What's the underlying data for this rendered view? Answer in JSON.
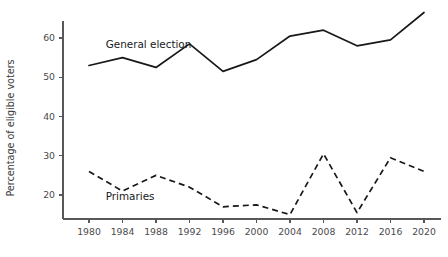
{
  "chart_data": {
    "type": "line",
    "title": "",
    "xlabel": "",
    "ylabel": "Percentage of eligible voters",
    "x": [
      1980,
      1984,
      1988,
      1992,
      1996,
      2000,
      2004,
      2008,
      2012,
      2016,
      2020
    ],
    "xtick_labels": [
      "1980",
      "1984",
      "1988",
      "1992",
      "1996",
      "2000",
      "2004",
      "2008",
      "2012",
      "2016",
      "2020"
    ],
    "ytick_labels": [
      "20",
      "30",
      "40",
      "50",
      "60"
    ],
    "yticks": [
      20,
      30,
      40,
      50,
      60
    ],
    "ylim": [
      13,
      69
    ],
    "xlim": [
      1978.6,
      2021.6
    ],
    "grid": false,
    "legend": "inline-annotations",
    "series": [
      {
        "name": "General election",
        "style": "solid",
        "color": "#18181a",
        "label_position": {
          "x": 1982.0,
          "y": 57.5
        },
        "values": [
          53.0,
          55.0,
          52.5,
          58.5,
          51.5,
          54.5,
          60.5,
          62.0,
          58.0,
          59.5,
          66.5
        ]
      },
      {
        "name": "Primaries",
        "style": "dashed",
        "color": "#18181a",
        "label_position": {
          "x": 1982.0,
          "y": 18.6
        },
        "values": [
          26.0,
          21.0,
          25.0,
          22.0,
          17.0,
          17.5,
          15.0,
          30.5,
          15.5,
          29.5,
          26.0
        ]
      }
    ]
  }
}
